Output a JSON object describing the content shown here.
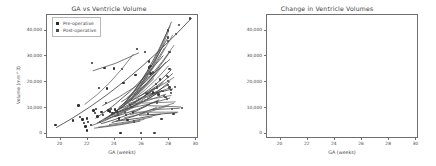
{
  "figure": {
    "panels": [
      "ga-vs-ventricle-volume",
      "change-in-ventricle-volumes"
    ]
  },
  "left_panel": {
    "title": "GA vs Ventricle Volume",
    "xlabel": "GA (weeks)",
    "ylabel": "Volume (mm^3)",
    "legend": {
      "items": [
        {
          "label": "Pre-operative",
          "color": "#2b2b2b"
        },
        {
          "label": "Post-operative",
          "color": "#4a4a4a"
        }
      ]
    }
  },
  "right_panel": {
    "title": "Change in Ventricle Volumes",
    "xlabel": "GA (weeks)",
    "ylabel": "Volume (mm^3)"
  },
  "chart_data": [
    {
      "type": "scatter",
      "title": "GA vs Ventricle Volume",
      "xlabel": "GA (weeks)",
      "ylabel": "Volume (mm^3)",
      "xlim": [
        19,
        30.2
      ],
      "ylim": [
        -2000,
        46000
      ],
      "xticks": [
        20,
        22,
        24,
        26,
        28,
        30
      ],
      "yticks": [
        0,
        10000,
        20000,
        30000,
        40000
      ],
      "ytick_labels": [
        "0",
        "10,000",
        "20,000",
        "30,000",
        "40,000"
      ],
      "grid": false,
      "legend": [
        "Pre-operative",
        "Post-operative"
      ],
      "legend_position": "upper left",
      "series": [
        {
          "name": "Pre-operative",
          "color": "#2b2b2b",
          "points": [
            [
              19.7,
              3100
            ],
            [
              21.0,
              4700
            ],
            [
              21.4,
              10600
            ],
            [
              21.5,
              6200
            ],
            [
              21.7,
              5200
            ],
            [
              21.8,
              3800
            ],
            [
              21.9,
              2500
            ],
            [
              22.0,
              900
            ],
            [
              22.0,
              5600
            ],
            [
              22.1,
              4300
            ],
            [
              22.3,
              3100
            ],
            [
              22.4,
              27000
            ],
            [
              22.5,
              8700
            ],
            [
              22.6,
              7600
            ],
            [
              22.7,
              9200
            ],
            [
              22.8,
              6300
            ],
            [
              22.9,
              17300
            ],
            [
              23.0,
              4300
            ],
            [
              23.1,
              8000
            ],
            [
              23.2,
              6900
            ],
            [
              23.3,
              25000
            ],
            [
              23.4,
              11600
            ],
            [
              23.5,
              17100
            ],
            [
              23.6,
              8700
            ],
            [
              23.7,
              8200
            ],
            [
              23.8,
              9200
            ],
            [
              23.9,
              7700
            ],
            [
              24.0,
              24900
            ],
            [
              24.1,
              9000
            ],
            [
              24.2,
              8300
            ],
            [
              24.3,
              7100
            ],
            [
              24.4,
              5500
            ],
            [
              24.5,
              0
            ],
            [
              24.6,
              24800
            ],
            [
              24.7,
              19200
            ],
            [
              24.8,
              8000
            ],
            [
              24.9,
              6900
            ],
            [
              25.0,
              4900
            ],
            [
              25.2,
              10800
            ],
            [
              25.3,
              10100
            ],
            [
              25.4,
              7900
            ],
            [
              25.5,
              4400
            ],
            [
              25.6,
              22300
            ],
            [
              25.7,
              32400
            ],
            [
              26.0,
              0
            ],
            [
              26.3,
              31300
            ],
            [
              26.5,
              7200
            ],
            [
              26.6,
              25300
            ],
            [
              26.7,
              23000
            ],
            [
              26.9,
              15600
            ]
          ]
        },
        {
          "name": "Post-operative",
          "color": "#3d3d3d",
          "points": [
            [
              26.6,
              27600
            ],
            [
              26.7,
              25800
            ],
            [
              26.9,
              23400
            ],
            [
              27.0,
              0
            ],
            [
              27.1,
              19000
            ],
            [
              27.2,
              17600
            ],
            [
              27.3,
              14900
            ],
            [
              27.4,
              20600
            ],
            [
              27.5,
              5300
            ],
            [
              27.6,
              16300
            ],
            [
              27.7,
              14200
            ],
            [
              27.8,
              13900
            ],
            [
              27.9,
              13200
            ],
            [
              27.9,
              22000
            ],
            [
              28.0,
              21500
            ],
            [
              28.0,
              20000
            ],
            [
              28.0,
              18500
            ],
            [
              28.0,
              35500
            ],
            [
              28.0,
              36900
            ],
            [
              28.0,
              39600
            ],
            [
              28.1,
              31400
            ],
            [
              28.1,
              24700
            ],
            [
              28.1,
              17600
            ],
            [
              28.2,
              16600
            ],
            [
              28.2,
              15400
            ],
            [
              28.3,
              9200
            ],
            [
              28.4,
              7200
            ],
            [
              28.5,
              17800
            ],
            [
              28.6,
              38300
            ],
            [
              28.8,
              41800
            ],
            [
              29.0,
              9700
            ],
            [
              29.6,
              44200
            ],
            [
              27.2,
              11800
            ],
            [
              26.4,
              15400
            ]
          ]
        }
      ]
    },
    {
      "type": "line",
      "title": "Change in Ventricle Volumes",
      "xlabel": "GA (weeks)",
      "ylabel": "Volume (mm^3)",
      "xlim": [
        19,
        30.2
      ],
      "ylim": [
        -2000,
        46000
      ],
      "xticks": [
        20,
        22,
        24,
        26,
        28,
        30
      ],
      "yticks": [
        0,
        10000,
        20000,
        30000,
        40000
      ],
      "ytick_labels": [
        "0",
        "10,000",
        "20,000",
        "30,000",
        "40,000"
      ],
      "grid": false,
      "legend_position": "none",
      "description": "Spaghetti plot of per-subject ventricle volume trajectories between pre- and post-operative gestational ages",
      "trajectories": [
        [
          [
            19.6,
            2000
          ],
          [
            29.6,
            44500
          ]
        ],
        [
          [
            22.3,
            24000
          ],
          [
            25.7,
            31000
          ]
        ],
        [
          [
            21.7,
            11000
          ],
          [
            25.3,
            30500
          ]
        ],
        [
          [
            22.5,
            5600
          ],
          [
            27.5,
            29900
          ]
        ],
        [
          [
            23.0,
            10500
          ],
          [
            28.0,
            28500
          ]
        ],
        [
          [
            24.3,
            9000
          ],
          [
            28.2,
            38000
          ]
        ],
        [
          [
            24.6,
            11000
          ],
          [
            28.0,
            41500
          ]
        ],
        [
          [
            25.0,
            12000
          ],
          [
            28.1,
            43000
          ]
        ],
        [
          [
            25.4,
            14500
          ],
          [
            27.9,
            39500
          ]
        ],
        [
          [
            23.8,
            7000
          ],
          [
            27.8,
            36500
          ]
        ],
        [
          [
            24.0,
            8200
          ],
          [
            27.6,
            33000
          ]
        ],
        [
          [
            24.8,
            13500
          ],
          [
            28.3,
            34000
          ]
        ],
        [
          [
            25.8,
            18000
          ],
          [
            28.0,
            31500
          ]
        ],
        [
          [
            23.4,
            6000
          ],
          [
            27.3,
            25500
          ]
        ],
        [
          [
            23.1,
            5000
          ],
          [
            27.0,
            23000
          ]
        ],
        [
          [
            22.8,
            4300
          ],
          [
            26.8,
            21000
          ]
        ],
        [
          [
            24.2,
            9800
          ],
          [
            27.7,
            27500
          ]
        ],
        [
          [
            24.5,
            10200
          ],
          [
            27.9,
            26000
          ]
        ],
        [
          [
            25.2,
            12500
          ],
          [
            28.1,
            24500
          ]
        ],
        [
          [
            25.6,
            13800
          ],
          [
            28.2,
            23000
          ]
        ],
        [
          [
            26.0,
            15000
          ],
          [
            28.3,
            21500
          ]
        ],
        [
          [
            23.6,
            6800
          ],
          [
            26.9,
            17500
          ]
        ],
        [
          [
            23.2,
            5500
          ],
          [
            26.6,
            16000
          ]
        ],
        [
          [
            22.6,
            3800
          ],
          [
            26.3,
            14000
          ]
        ],
        [
          [
            24.4,
            9500
          ],
          [
            27.5,
            19500
          ]
        ],
        [
          [
            24.9,
            11200
          ],
          [
            27.8,
            18500
          ]
        ],
        [
          [
            25.5,
            13000
          ],
          [
            28.0,
            17500
          ]
        ],
        [
          [
            26.2,
            14800
          ],
          [
            28.2,
            17000
          ]
        ],
        [
          [
            22.2,
            2800
          ],
          [
            26.0,
            12500
          ]
        ],
        [
          [
            23.3,
            5200
          ],
          [
            27.1,
            15500
          ]
        ],
        [
          [
            24.1,
            7800
          ],
          [
            27.4,
            16500
          ]
        ],
        [
          [
            25.1,
            10800
          ],
          [
            27.7,
            15000
          ]
        ],
        [
          [
            26.1,
            12800
          ],
          [
            28.1,
            14500
          ]
        ],
        [
          [
            22.9,
            3500
          ],
          [
            26.5,
            11000
          ]
        ],
        [
          [
            24.7,
            9200
          ],
          [
            28.0,
            13500
          ]
        ],
        [
          [
            25.9,
            11500
          ],
          [
            28.4,
            12000
          ]
        ],
        [
          [
            23.9,
            6200
          ],
          [
            27.2,
            12800
          ]
        ],
        [
          [
            26.4,
            10500
          ],
          [
            28.8,
            10000
          ]
        ],
        [
          [
            25.3,
            8000
          ],
          [
            28.6,
            8000
          ]
        ],
        [
          [
            24.0,
            4500
          ],
          [
            27.3,
            7200
          ]
        ],
        [
          [
            23.5,
            3200
          ],
          [
            26.7,
            6200
          ]
        ],
        [
          [
            22.7,
            2200
          ],
          [
            26.1,
            5200
          ]
        ],
        [
          [
            25.7,
            6800
          ],
          [
            28.5,
            7800
          ]
        ],
        [
          [
            26.6,
            9000
          ],
          [
            28.7,
            9500
          ]
        ],
        [
          [
            24.6,
            5800
          ],
          [
            27.9,
            10500
          ]
        ],
        [
          [
            23.7,
            4000
          ],
          [
            27.0,
            9800
          ]
        ],
        [
          [
            22.4,
            1800
          ],
          [
            25.8,
            4500
          ]
        ],
        [
          [
            25.0,
            7000
          ],
          [
            28.3,
            11500
          ]
        ],
        [
          [
            26.3,
            13500
          ],
          [
            28.0,
            20000
          ]
        ],
        [
          [
            24.4,
            12000
          ],
          [
            26.9,
            22500
          ]
        ]
      ]
    }
  ]
}
